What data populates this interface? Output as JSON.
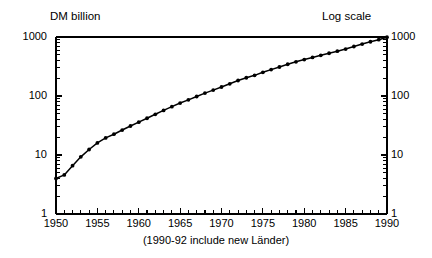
{
  "chart_data": {
    "type": "line",
    "title": "",
    "top_left_label": "DM billion",
    "top_right_label": "Log scale",
    "caption": "(1990-92 include new Länder)",
    "xlabel": "",
    "ylabel": "DM billion",
    "yscale": "log",
    "ylim": [
      1,
      1000
    ],
    "xlim": [
      1950,
      1990
    ],
    "grid": false,
    "legend": null,
    "y_tick_labels_left": [
      "1000",
      "100",
      "10",
      "1"
    ],
    "y_tick_labels_right": [
      "1000",
      "100",
      "10",
      "1"
    ],
    "y_tick_values": [
      1000,
      100,
      10,
      1
    ],
    "x_tick_labels": [
      "1950",
      "1955",
      "1960",
      "1965",
      "1970",
      "1975",
      "1980",
      "1985",
      "1990"
    ],
    "x_tick_values": [
      1950,
      1955,
      1960,
      1965,
      1970,
      1975,
      1980,
      1985,
      1990
    ],
    "x_minor_tick_step": 1,
    "marker": "filled-circle",
    "line_color": "#000000",
    "series": [
      {
        "name": "DM billion",
        "x": [
          1950,
          1951,
          1952,
          1953,
          1954,
          1955,
          1956,
          1957,
          1958,
          1959,
          1960,
          1961,
          1962,
          1963,
          1964,
          1965,
          1966,
          1967,
          1968,
          1969,
          1970,
          1971,
          1972,
          1973,
          1974,
          1975,
          1976,
          1977,
          1978,
          1979,
          1980,
          1981,
          1982,
          1983,
          1984,
          1985,
          1986,
          1987,
          1988,
          1989,
          1990
        ],
        "values": [
          4.0,
          4.6,
          6.6,
          9.3,
          12.4,
          16.0,
          19.5,
          22.5,
          26.5,
          31.0,
          36.0,
          42.0,
          49.0,
          57.0,
          66.0,
          76.0,
          86.0,
          98.0,
          112.0,
          126.0,
          142.0,
          161.0,
          183.0,
          204.0,
          224.0,
          252.0,
          280.0,
          310.0,
          345.0,
          380.0,
          415.0,
          450.0,
          490.0,
          530.0,
          575.0,
          625.0,
          690.0,
          760.0,
          830.0,
          900.0,
          990.0
        ]
      }
    ]
  }
}
